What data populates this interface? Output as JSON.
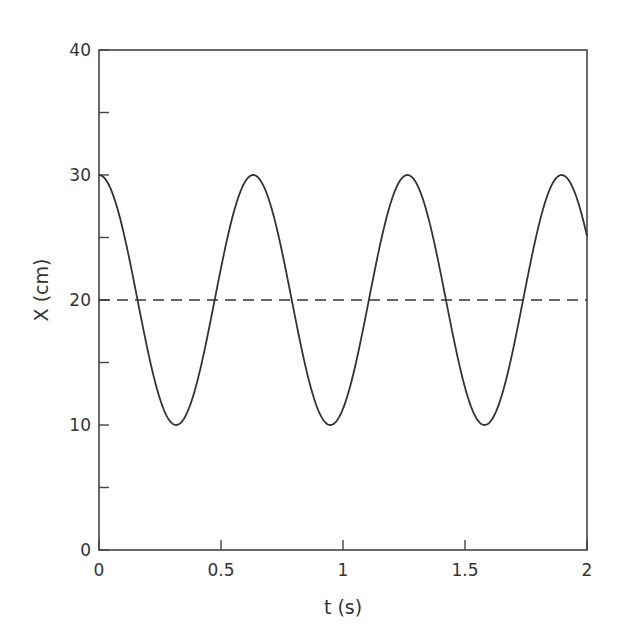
{
  "chart_data": {
    "type": "line",
    "title": "",
    "xlabel": "t (s)",
    "ylabel": "X (cm)",
    "xlim": [
      0,
      2
    ],
    "ylim": [
      0,
      40
    ],
    "x_ticks": [
      0,
      0.5,
      1,
      1.5,
      2
    ],
    "x_tick_labels": [
      "0",
      "0.5",
      "1",
      "1.5",
      "2"
    ],
    "y_ticks": [
      0,
      10,
      20,
      30,
      40
    ],
    "y_tick_labels": [
      "0",
      "10",
      "20",
      "30",
      "40"
    ],
    "y_minor_ticks": [
      5,
      15,
      25,
      35
    ],
    "grid": false,
    "legend": null,
    "series": [
      {
        "name": "position",
        "style": "solid",
        "function": "X = 20 + 10 cos(2*pi*t / 0.632)",
        "equilibrium_cm": 20,
        "amplitude_cm": 10,
        "period_s": 0.632,
        "peaks": [
          {
            "t": 0,
            "x": 30
          },
          {
            "t": 0.63,
            "x": 30
          },
          {
            "t": 1.26,
            "x": 30
          },
          {
            "t": 1.9,
            "x": 30
          }
        ],
        "troughs": [
          {
            "t": 0.31,
            "x": 10
          },
          {
            "t": 0.95,
            "x": 10
          },
          {
            "t": 1.57,
            "x": 10
          }
        ],
        "end_value": {
          "t": 2,
          "x": 24.4
        }
      },
      {
        "name": "equilibrium",
        "style": "dashed",
        "x": [
          0,
          2
        ],
        "values": [
          20,
          20
        ]
      }
    ]
  },
  "axes": {
    "xlabel": "t (s)",
    "ylabel": "X (cm)"
  }
}
